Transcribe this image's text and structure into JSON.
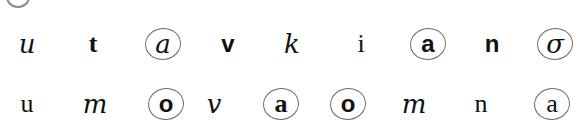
{
  "rows": [
    {
      "y": 44,
      "items": [
        {
          "char": "u",
          "style": "cursive",
          "circled": false,
          "x": 27
        },
        {
          "char": "t",
          "style": "serif-bold",
          "circled": false,
          "x": 93
        },
        {
          "char": "a",
          "style": "cursive",
          "circled": true,
          "x": 163
        },
        {
          "char": "v",
          "style": "sans-bold",
          "circled": false,
          "x": 228
        },
        {
          "char": "k",
          "style": "cursive",
          "circled": false,
          "x": 292
        },
        {
          "char": "i",
          "style": "serif",
          "circled": false,
          "x": 361
        },
        {
          "char": "a",
          "style": "sans-bold",
          "circled": true,
          "x": 428
        },
        {
          "char": "n",
          "style": "sans-bold",
          "circled": false,
          "x": 492
        },
        {
          "char": "σ",
          "style": "cursive",
          "circled": true,
          "x": 555
        }
      ]
    },
    {
      "y": 104,
      "items": [
        {
          "char": "u",
          "style": "serif",
          "circled": false,
          "x": 27
        },
        {
          "char": "m",
          "style": "cursive",
          "circled": false,
          "x": 95
        },
        {
          "char": "o",
          "style": "sans-bold",
          "circled": true,
          "x": 166
        },
        {
          "char": "v",
          "style": "cursive",
          "circled": false,
          "x": 214
        },
        {
          "char": "a",
          "style": "serif-bold",
          "circled": true,
          "x": 281
        },
        {
          "char": "o",
          "style": "sans-bold",
          "circled": true,
          "x": 348
        },
        {
          "char": "m",
          "style": "cursive",
          "circled": false,
          "x": 414
        },
        {
          "char": "n",
          "style": "serif",
          "circled": false,
          "x": 481
        },
        {
          "char": "a",
          "style": "serif",
          "circled": true,
          "x": 552
        }
      ]
    }
  ],
  "colors": {
    "ink": "#111111",
    "circle": "#6a6a6a",
    "background": "#ffffff"
  }
}
